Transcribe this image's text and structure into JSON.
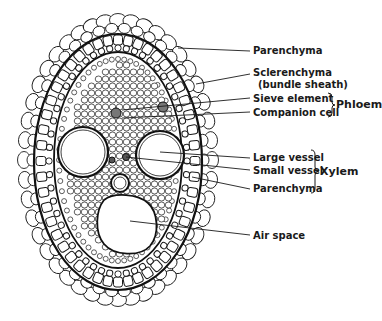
{
  "diagram": {
    "type": "anatomical cross-section",
    "labels": [
      {
        "id": "parenchyma-outer",
        "text": "Parenchyma"
      },
      {
        "id": "sclerenchyma",
        "text": "Sclerenchyma"
      },
      {
        "id": "bundle-sheath",
        "text": "(bundle sheath)"
      },
      {
        "id": "sieve-element",
        "text": "Sieve element"
      },
      {
        "id": "companion-cell",
        "text": "Companion cell"
      },
      {
        "id": "large-vessel",
        "text": "Large vessel"
      },
      {
        "id": "small-vessel",
        "text": "Small vessel"
      },
      {
        "id": "parenchyma-xylem",
        "text": "Parenchyma"
      },
      {
        "id": "air-space",
        "text": "Air space"
      }
    ],
    "groups": [
      {
        "id": "phloem",
        "text": "Phloem",
        "members": [
          "Sieve element",
          "Companion cell"
        ]
      },
      {
        "id": "xylem",
        "text": "Xylem",
        "members": [
          "Large vessel",
          "Small vessel",
          "Parenchyma"
        ]
      }
    ],
    "colors": {
      "ink": "#1a1a1a",
      "background": "#ffffff",
      "cell_fill": "#ffffff"
    }
  }
}
